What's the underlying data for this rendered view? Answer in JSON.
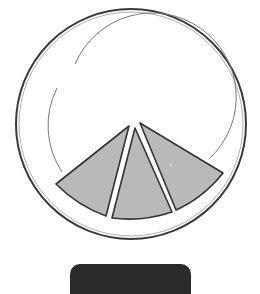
{
  "illustration": {
    "subject": "plate with three slices",
    "plate": {
      "outline_color": "#333333",
      "fill": "#ffffff"
    },
    "slices": [
      {
        "name": "left-slice",
        "fill": "#b9b9b9"
      },
      {
        "name": "middle-slice",
        "fill": "#b9b9b9"
      },
      {
        "name": "right-slice",
        "fill": "#b9b9b9"
      }
    ],
    "slice_count": 3
  },
  "bottom_button": {
    "label": "",
    "color": "#2a2a2a"
  }
}
